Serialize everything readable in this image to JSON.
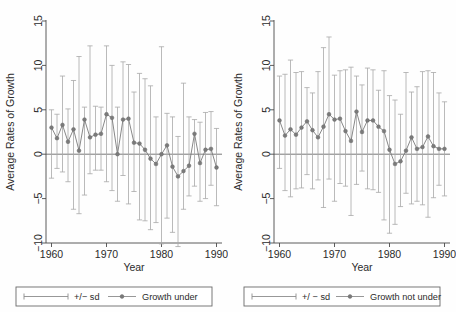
{
  "figure": {
    "background": "#fefefe",
    "ink_color": "#4d4d4d",
    "marker_color": "#7a7a7a",
    "whisker_color": "#a8a8a8",
    "axis_color": "#4a4a4a"
  },
  "panels": [
    {
      "id": "left-panel",
      "ylabel": "Average Rates of Growth",
      "xlabel": "Year",
      "legend": {
        "sd_label": "+/− sd",
        "series_label": "Growth under"
      },
      "chart_data": {
        "type": "line",
        "title": "",
        "xlabel": "Year",
        "ylabel": "Average Rates of Growth",
        "xlim": [
          1959,
          1991
        ],
        "ylim": [
          -10,
          15
        ],
        "xticks": [
          1960,
          1970,
          1980,
          1990
        ],
        "yticks": [
          -10,
          -5,
          0,
          5,
          10,
          15
        ],
        "grid": false,
        "legend_position": "below-axis",
        "zero_line": 0,
        "error_bars": "mean +/- 1 sd",
        "series": [
          {
            "name": "Growth under",
            "x": [
              1960,
              1961,
              1962,
              1963,
              1964,
              1965,
              1966,
              1967,
              1968,
              1969,
              1970,
              1971,
              1972,
              1973,
              1974,
              1975,
              1976,
              1977,
              1978,
              1979,
              1980,
              1981,
              1982,
              1983,
              1984,
              1985,
              1986,
              1987,
              1988,
              1989,
              1990
            ],
            "values": [
              3.0,
              1.8,
              3.3,
              1.4,
              2.8,
              0.4,
              3.9,
              1.9,
              2.2,
              2.3,
              4.5,
              4.1,
              0.0,
              3.9,
              4.0,
              1.3,
              1.2,
              0.5,
              -0.5,
              -1.1,
              0.0,
              1.0,
              -1.4,
              -2.5,
              -1.9,
              -1.3,
              2.3,
              -1.0,
              0.5,
              0.6,
              -1.5
            ],
            "sd_upper": [
              5.0,
              4.5,
              8.8,
              5.1,
              8.3,
              11.0,
              5.3,
              12.2,
              5.4,
              5.3,
              12.2,
              10.0,
              5.3,
              10.4,
              10.1,
              7.0,
              9.1,
              8.5,
              7.7,
              4.2,
              12.1,
              4.6,
              4.2,
              2.0,
              8.0,
              4.2,
              3.9,
              3.6,
              4.7,
              4.8,
              2.9
            ],
            "sd_lower": [
              -2.7,
              -1.6,
              -2.0,
              -3.1,
              -6.2,
              -6.7,
              -4.6,
              -2.2,
              -1.8,
              -1.8,
              -3.1,
              -4.1,
              -5.3,
              -2.4,
              -5.6,
              -4.2,
              -7.4,
              -7.5,
              -8.5,
              -7.7,
              -10.1,
              -7.2,
              -8.8,
              -10.4,
              -6.2,
              -4.7,
              -3.6,
              -5.3,
              -5.0,
              -3.5,
              -5.8
            ]
          }
        ]
      }
    },
    {
      "id": "right-panel",
      "ylabel": "Average Rates of Growth",
      "xlabel": "Year",
      "legend": {
        "sd_label": "+/ − sd",
        "series_label": "Growth not under"
      },
      "chart_data": {
        "type": "line",
        "title": "",
        "xlabel": "Year",
        "ylabel": "Average Rates of Growth",
        "xlim": [
          1959,
          1991
        ],
        "ylim": [
          -10,
          15
        ],
        "xticks": [
          1960,
          1970,
          1980,
          1990
        ],
        "yticks": [
          -10,
          -5,
          0,
          5,
          10,
          15
        ],
        "grid": false,
        "legend_position": "below-axis",
        "zero_line": 0,
        "error_bars": "mean +/- 1 sd",
        "series": [
          {
            "name": "Growth not under",
            "x": [
              1960,
              1961,
              1962,
              1963,
              1964,
              1965,
              1966,
              1967,
              1968,
              1969,
              1970,
              1971,
              1972,
              1973,
              1974,
              1975,
              1976,
              1977,
              1978,
              1979,
              1980,
              1981,
              1982,
              1983,
              1984,
              1985,
              1986,
              1987,
              1988,
              1989,
              1990
            ],
            "values": [
              3.8,
              2.1,
              2.8,
              2.2,
              3.0,
              3.7,
              2.7,
              1.9,
              3.1,
              4.5,
              3.9,
              4.0,
              2.6,
              1.5,
              4.8,
              2.5,
              3.8,
              3.8,
              3.1,
              2.6,
              0.5,
              -1.1,
              -0.8,
              0.4,
              1.9,
              0.6,
              0.8,
              2.0,
              0.9,
              0.6,
              0.6
            ],
            "sd_upper": [
              8.8,
              9.0,
              10.6,
              9.2,
              9.3,
              7.5,
              6.9,
              9.3,
              12.0,
              13.2,
              8.9,
              9.4,
              9.5,
              9.8,
              8.8,
              7.8,
              9.7,
              9.5,
              7.2,
              9.4,
              6.6,
              6.1,
              4.5,
              9.2,
              7.0,
              7.6,
              9.3,
              9.4,
              9.2,
              6.9,
              5.9
            ],
            "sd_lower": [
              -1.6,
              -4.1,
              -4.8,
              -3.9,
              -3.8,
              -2.3,
              -3.9,
              -2.9,
              -6.0,
              -2.8,
              -5.3,
              -3.3,
              -3.6,
              -6.9,
              -3.4,
              -1.9,
              -3.9,
              -4.0,
              -4.3,
              -7.4,
              -8.9,
              -7.9,
              -5.9,
              -4.4,
              -5.6,
              -5.3,
              -5.7,
              -7.1,
              -4.9,
              -3.5,
              -4.7
            ]
          }
        ]
      }
    }
  ]
}
